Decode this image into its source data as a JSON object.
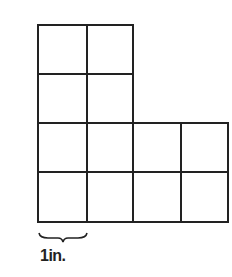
{
  "figure": {
    "unit_label": "1in.",
    "rows": [
      {
        "row": 1,
        "squares": 2
      },
      {
        "row": 2,
        "squares": 2
      },
      {
        "row": 3,
        "squares": 4
      },
      {
        "row": 4,
        "squares": 4
      }
    ],
    "total_squares": 12,
    "line_color": "#222222"
  }
}
